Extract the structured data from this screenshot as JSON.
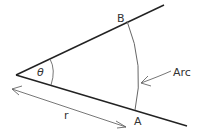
{
  "diagram": {
    "labels": {
      "point_b": "B",
      "point_a": "A",
      "angle": "θ",
      "arc": "Arc",
      "radius": "r"
    },
    "colors": {
      "line": "#222222",
      "arc": "#666666",
      "text": "#333333"
    }
  }
}
